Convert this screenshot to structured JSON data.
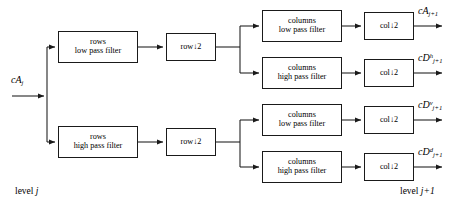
{
  "diagram": {
    "stroke_color": "#1a1a1a",
    "background": "#ffffff",
    "input": {
      "name": "cA",
      "sub": "j"
    },
    "levels": {
      "left": "level",
      "left_sub": "j",
      "right": "level",
      "right_sub": "j+1"
    },
    "boxes": {
      "rows_low": {
        "line1": "rows",
        "line2": "low pass filter"
      },
      "rows_high": {
        "line1": "rows",
        "line2": "high pass filter"
      },
      "row_down_top": {
        "line1": "row↓2"
      },
      "row_down_bottom": {
        "line1": "row↓2"
      },
      "cols_low_1": {
        "line1": "columns",
        "line2": "low pass filter"
      },
      "cols_high_1": {
        "line1": "columns",
        "line2": "high pass filter"
      },
      "cols_low_2": {
        "line1": "columns",
        "line2": "low pass filter"
      },
      "cols_high_2": {
        "line1": "columns",
        "line2": "high pass filter"
      },
      "col_down_1": {
        "line1": "col↓2"
      },
      "col_down_2": {
        "line1": "col↓2"
      },
      "col_down_3": {
        "line1": "col↓2"
      },
      "col_down_4": {
        "line1": "col↓2"
      }
    },
    "outputs": [
      {
        "name": "cA",
        "sup": "",
        "sub": "j+1"
      },
      {
        "name": "cD",
        "sup": "h",
        "sub": "j+1"
      },
      {
        "name": "cD",
        "sup": "v",
        "sub": "j+1"
      },
      {
        "name": "cD",
        "sup": "d",
        "sub": "j+1"
      }
    ]
  }
}
